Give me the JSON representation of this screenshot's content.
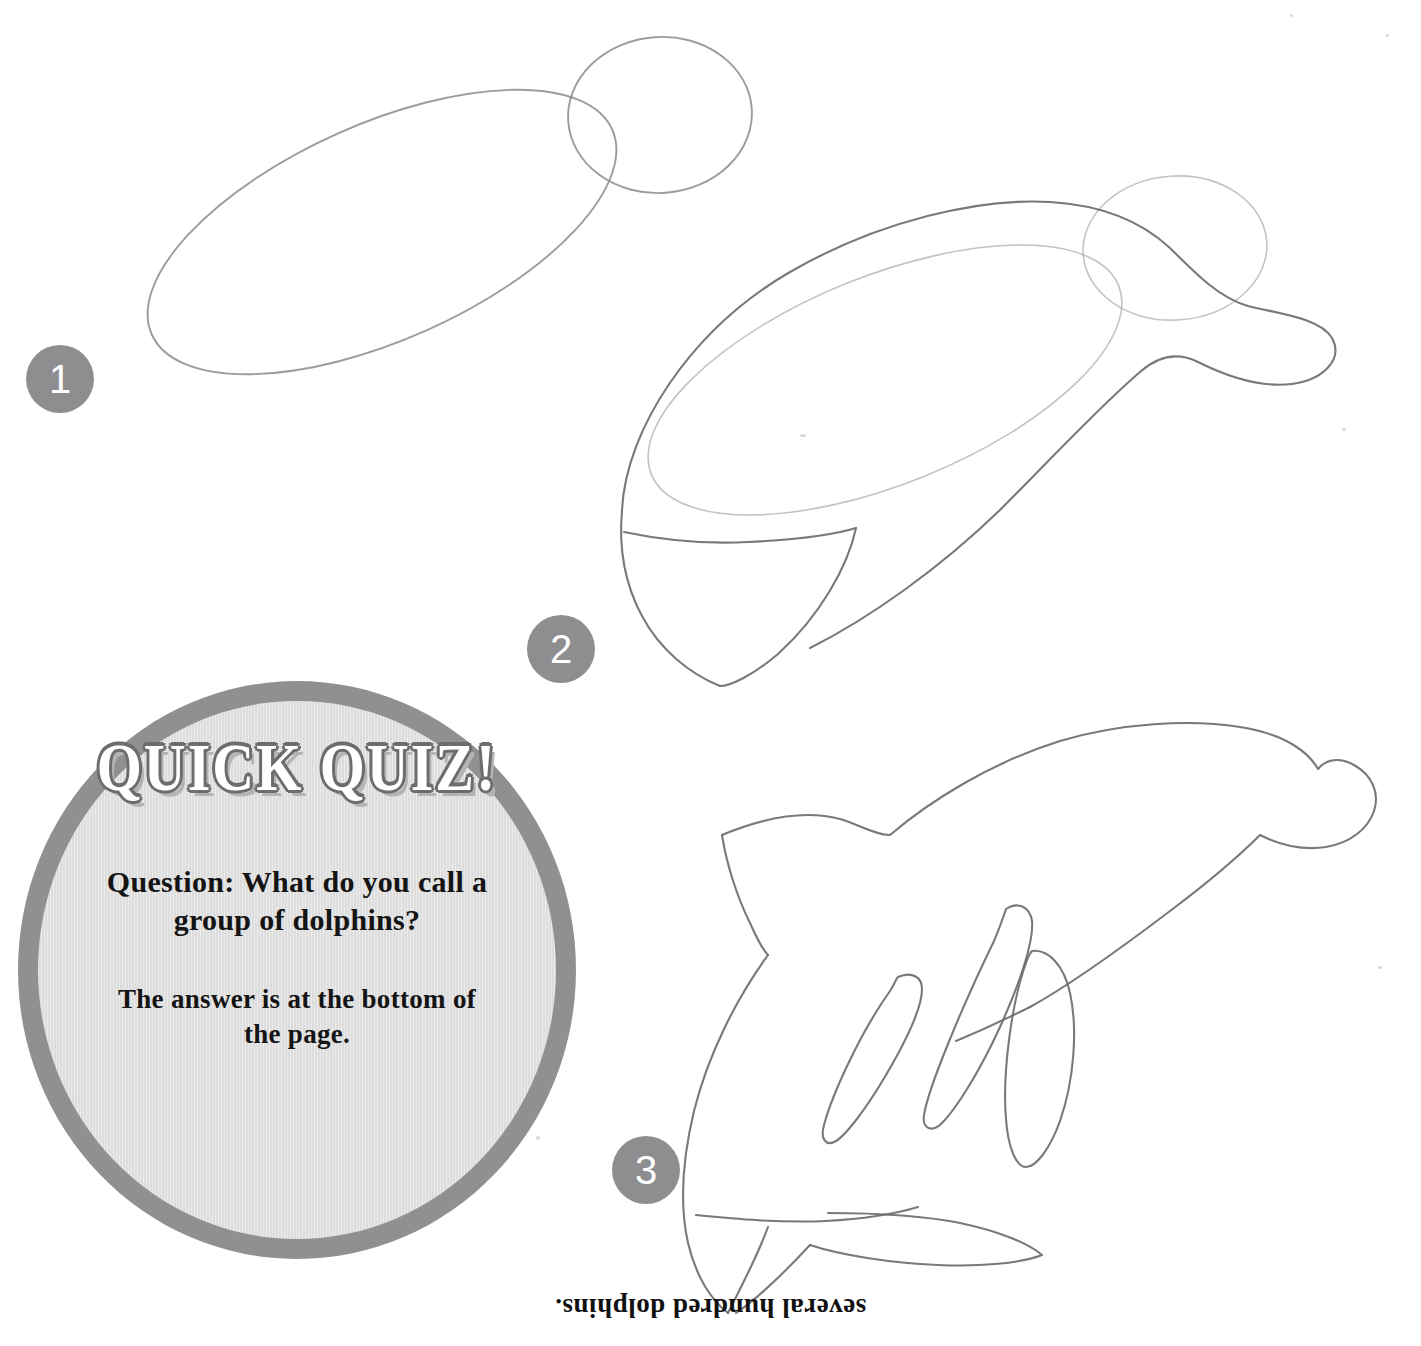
{
  "page": {
    "background_color": "#ffffff",
    "accent_gray": "#909092",
    "bubble_fill": "#dddddd",
    "pencil_color": "#6e6e70"
  },
  "steps": [
    {
      "number": "1",
      "name": "step-1",
      "description": "tilted oval body guide with circle head guide"
    },
    {
      "number": "2",
      "name": "step-2",
      "description": "body outline with snout and tail fluke over guides"
    },
    {
      "number": "3",
      "name": "step-3",
      "description": "finished dolphin outline with dorsal fin, flippers and tail"
    }
  ],
  "quiz": {
    "title": "QUICK QUIZ!",
    "question": "Question: What do you call a group of dolphins?",
    "hint": "The answer is at the bottom of the page."
  },
  "answer": {
    "text": "several hundred dolphins.",
    "orientation": "upside-down"
  }
}
